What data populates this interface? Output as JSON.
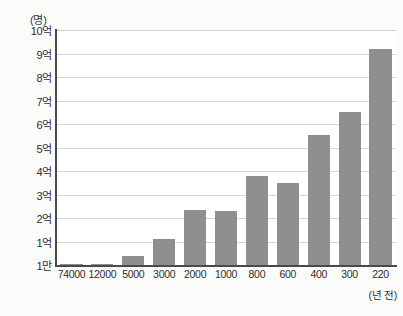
{
  "chart_data": {
    "type": "bar",
    "title": "",
    "subtitle": "",
    "xlabel": "(년 전)",
    "ylabel": "(명)",
    "unit_caption": "(명)",
    "categories": [
      "74000",
      "12000",
      "5000",
      "3000",
      "2000",
      "1000",
      "800",
      "600",
      "400",
      "300",
      "220"
    ],
    "values": [
      0.02,
      0.05,
      0.4,
      1.1,
      2.35,
      2.3,
      3.8,
      3.5,
      5.55,
      6.5,
      9.2
    ],
    "value_unit": "억",
    "ylim": [
      0,
      10
    ],
    "y_tick_labels": [
      "10억",
      "9억",
      "8억",
      "7억",
      "6억",
      "5억",
      "4억",
      "3억",
      "2억",
      "1억",
      "1만"
    ],
    "y_tick_values": [
      10,
      9,
      8,
      7,
      6,
      5,
      4,
      3,
      2,
      1,
      0
    ],
    "grid": true,
    "legend": "none",
    "bar_color": "#8f8f8f",
    "gridline_color": "#d6d6d6",
    "axis_color": "#4a4a4a",
    "plot_background": "#ffffff",
    "page_background": "#fbfbfa"
  }
}
